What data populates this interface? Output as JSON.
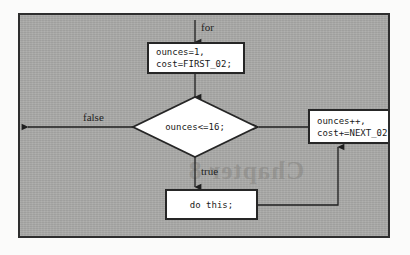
{
  "diagram": {
    "type": "flowchart",
    "background_color": "#a9a9a7",
    "border_color": "#2e2e2e",
    "node_fill": "#ffffff",
    "line_color": "#1f1f1f",
    "nodes": {
      "init": {
        "shape": "process",
        "line1": "ounces=1,",
        "line2": "cost=FIRST_02;"
      },
      "condition": {
        "shape": "decision",
        "text": "ounces<=16;"
      },
      "body": {
        "shape": "process",
        "text": "do this;"
      },
      "update": {
        "shape": "process",
        "line1": "ounces++,",
        "line2": "cost+=NEXT_02"
      }
    },
    "edge_labels": {
      "entry": "for",
      "false_branch": "false",
      "true_branch": "true"
    },
    "ghost_text": "Chapter 8"
  }
}
